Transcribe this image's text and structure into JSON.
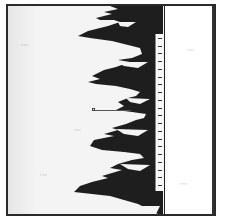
{
  "figure": {
    "type": "silhouette-diagram",
    "colors": {
      "frame": "#2a2a2a",
      "silhouette": "#1e1e1e",
      "background": "#f4f4f4",
      "panel": "#ffffff"
    }
  },
  "labels": {
    "left_top": "·····",
    "left_middle": "·····",
    "left_bottom": "·····",
    "right_top": "·····",
    "right_bottom": "·····"
  },
  "scale": {
    "tick_count": 20,
    "top_px": 34,
    "bottom_px": 191
  },
  "pointer": {
    "marker": "square",
    "y_px": 110
  }
}
